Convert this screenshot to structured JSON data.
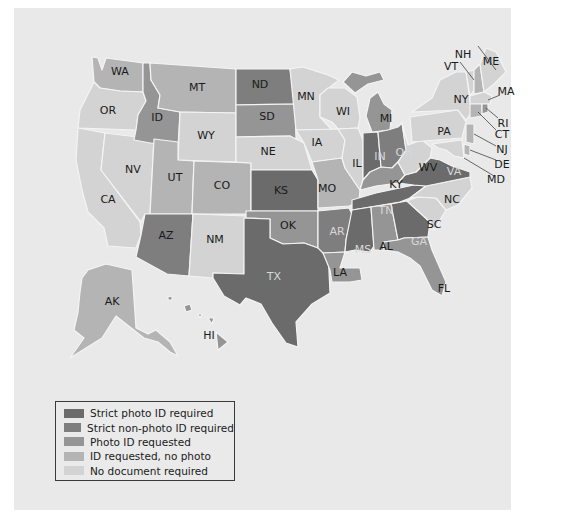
{
  "colors": {
    "background": "#e9e9e9",
    "strict_photo": "#6b6b6b",
    "strict_non_photo": "#7e7e7e",
    "photo_requested": "#959595",
    "id_no_photo": "#b4b4b4",
    "no_document": "#d3d3d3"
  },
  "legend": {
    "items": [
      {
        "key": "strict_photo",
        "label": "Strict photo ID required"
      },
      {
        "key": "strict_non_photo",
        "label": "Strict non-photo ID required"
      },
      {
        "key": "photo_requested",
        "label": "Photo ID requested"
      },
      {
        "key": "id_no_photo",
        "label": "ID requested, no photo"
      },
      {
        "key": "no_document",
        "label": "No document required"
      }
    ]
  },
  "states": {
    "WA": "id_no_photo",
    "OR": "no_document",
    "CA": "no_document",
    "NV": "no_document",
    "ID": "photo_requested",
    "MT": "id_no_photo",
    "WY": "no_document",
    "UT": "id_no_photo",
    "CO": "id_no_photo",
    "AZ": "strict_non_photo",
    "NM": "no_document",
    "ND": "strict_non_photo",
    "SD": "photo_requested",
    "NE": "no_document",
    "KS": "strict_photo",
    "OK": "photo_requested",
    "TX": "strict_photo",
    "MN": "no_document",
    "IA": "no_document",
    "MO": "id_no_photo",
    "AR": "strict_non_photo",
    "LA": "photo_requested",
    "WI": "no_document",
    "IL": "no_document",
    "MI": "photo_requested",
    "IN": "strict_photo",
    "OH": "strict_non_photo",
    "KY": "photo_requested",
    "TN": "strict_photo",
    "MS": "strict_photo",
    "AL": "photo_requested",
    "GA": "strict_photo",
    "FL": "photo_requested",
    "SC": "no_document",
    "NC": "no_document",
    "VA": "strict_photo",
    "WV": "no_document",
    "PA": "no_document",
    "NY": "no_document",
    "VT": "no_document",
    "NH": "id_no_photo",
    "ME": "no_document",
    "MA": "no_document",
    "RI": "photo_requested",
    "CT": "id_no_photo",
    "NJ": "id_no_photo",
    "DE": "id_no_photo",
    "MD": "no_document",
    "AK": "id_no_photo",
    "HI": "photo_requested"
  },
  "labels": {
    "WA": "WA",
    "OR": "OR",
    "CA": "CA",
    "NV": "NV",
    "ID": "ID",
    "MT": "MT",
    "WY": "WY",
    "UT": "UT",
    "CO": "CO",
    "AZ": "AZ",
    "NM": "NM",
    "ND": "ND",
    "SD": "SD",
    "NE": "NE",
    "KS": "KS",
    "OK": "OK",
    "TX": "TX",
    "MN": "MN",
    "IA": "IA",
    "MO": "MO",
    "AR": "AR",
    "LA": "LA",
    "WI": "WI",
    "IL": "IL",
    "MI": "MI",
    "IN": "IN",
    "OH": "OH",
    "KY": "KY",
    "TN": "TN",
    "MS": "MS",
    "AL": "AL",
    "GA": "GA",
    "FL": "FL",
    "SC": "SC",
    "NC": "NC",
    "VA": "VA",
    "WV": "WV",
    "PA": "PA",
    "NY": "NY",
    "VT": "VT",
    "NH": "NH",
    "ME": "ME",
    "MA": "MA",
    "RI": "RI",
    "CT": "CT",
    "NJ": "NJ",
    "DE": "DE",
    "MD": "MD",
    "AK": "AK",
    "HI": "HI"
  }
}
